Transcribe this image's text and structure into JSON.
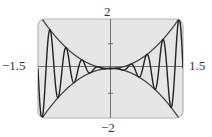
{
  "chart_data": {
    "type": "line",
    "title": "",
    "xlabel": "",
    "ylabel": "",
    "xlim": [
      -1.5,
      1.5
    ],
    "ylim": [
      -2,
      2
    ],
    "grid": false,
    "legend": null,
    "tick_labels": {
      "x_min": "−1.5",
      "x_max": "1.5",
      "y_min": "−2",
      "y_max": "2"
    },
    "y_ticks": [
      -1,
      1
    ],
    "series": [
      {
        "name": "y = x^2 sin(6πx)",
        "expression": "x*x*sin(6*pi*x)",
        "role": "oscillating curve"
      },
      {
        "name": "y = x^2",
        "expression": "x*x",
        "role": "upper envelope"
      },
      {
        "name": "y = -x^2",
        "expression": "-x*x",
        "role": "lower envelope"
      }
    ],
    "colors": {
      "plot_background": "#e6e6e6",
      "frame": "#b4b4b4",
      "curve": "#333333",
      "axis": "#555555"
    }
  }
}
